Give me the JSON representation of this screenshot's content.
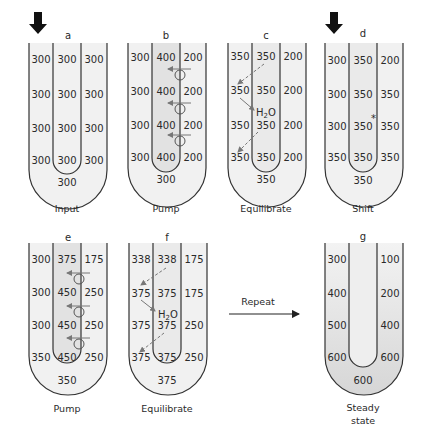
{
  "figure": {
    "panels": [
      {
        "id": "a",
        "letter": "a",
        "caption": "Input",
        "input_arrow": true,
        "descending": [
          "300",
          "300",
          "300",
          "300"
        ],
        "ascending": [
          "300",
          "300",
          "300",
          "300"
        ],
        "interstitial": [
          "300",
          "300",
          "300",
          "300"
        ],
        "bottom": "300"
      },
      {
        "id": "b",
        "letter": "b",
        "caption": "Pump",
        "input_arrow": false,
        "descending": [
          "300",
          "300",
          "300",
          "300"
        ],
        "ascending": [
          "400",
          "400",
          "400",
          "400"
        ],
        "interstitial": [
          "200",
          "200",
          "200",
          "200"
        ],
        "bottom": "300",
        "pumps": 3
      },
      {
        "id": "c",
        "letter": "c",
        "caption": "Equilibrate",
        "input_arrow": false,
        "descending": [
          "350",
          "350",
          "350",
          "350"
        ],
        "ascending": [
          "350",
          "350",
          "350",
          "350"
        ],
        "interstitial": [
          "200",
          "200",
          "200",
          "200"
        ],
        "bottom": "350",
        "water_label": "H2O"
      },
      {
        "id": "d",
        "letter": "d",
        "caption": "Shift",
        "input_arrow": true,
        "descending": [
          "300",
          "300",
          "300",
          "350"
        ],
        "ascending": [
          "350",
          "350",
          "350",
          "350"
        ],
        "interstitial": [
          "200",
          "350",
          "350",
          "350"
        ],
        "bottom": "350",
        "marker": "*"
      },
      {
        "id": "e",
        "letter": "e",
        "caption": "Pump",
        "input_arrow": false,
        "descending": [
          "300",
          "300",
          "300",
          "350"
        ],
        "ascending": [
          "375",
          "450",
          "450",
          "450"
        ],
        "interstitial": [
          "175",
          "250",
          "250",
          "250"
        ],
        "bottom": "350",
        "pumps": 3
      },
      {
        "id": "f",
        "letter": "f",
        "caption": "Equilibrate",
        "input_arrow": false,
        "descending": [
          "338",
          "375",
          "375",
          "375"
        ],
        "ascending": [
          "338",
          "375",
          "375",
          "375"
        ],
        "interstitial": [
          "175",
          "175",
          "250",
          "250"
        ],
        "bottom": "375",
        "water_label": "H2O"
      },
      {
        "id": "g",
        "letter": "g",
        "caption_line1": "Steady",
        "caption_line2": "state",
        "input_arrow": false,
        "descending": [
          "300",
          "400",
          "500",
          "600"
        ],
        "interstitial": [
          "100",
          "200",
          "400",
          "600"
        ],
        "bottom": "600"
      }
    ],
    "repeat_label": "Repeat",
    "h2o_main": "H",
    "h2o_sub": "2",
    "h2o_tail": "O",
    "marker": "*",
    "colors": {
      "stroke": "#333333",
      "shade": "#e9e9e9",
      "shade_dark": "#d8d8d8",
      "arrow": "#777777"
    }
  }
}
